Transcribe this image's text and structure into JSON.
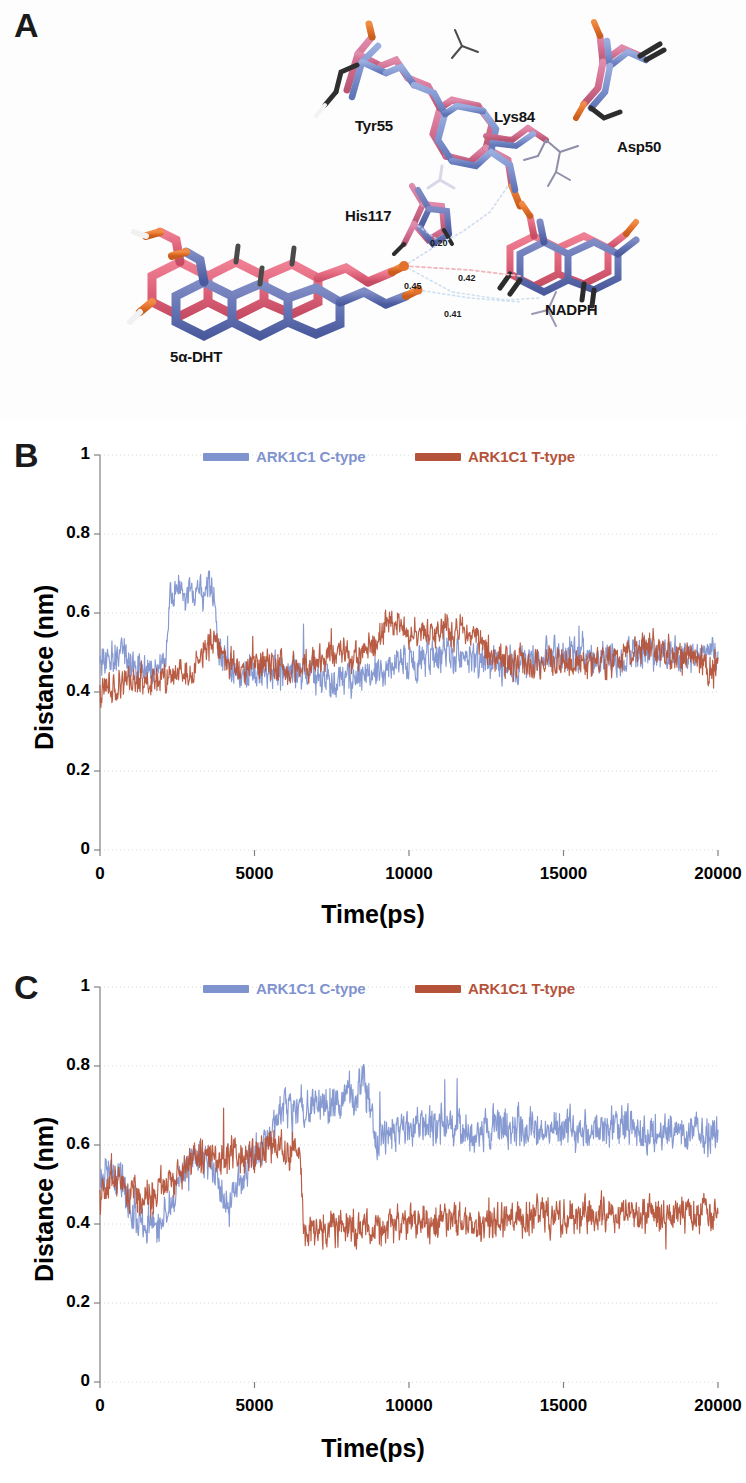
{
  "figure": {
    "panels": [
      {
        "letter": "A",
        "type": "molecular-structure"
      },
      {
        "letter": "B",
        "type": "line-chart"
      },
      {
        "letter": "C",
        "type": "line-chart"
      }
    ]
  },
  "panel_a": {
    "letter": "A",
    "caption_labels": [
      {
        "name": "tyr55",
        "text": "Tyr55",
        "x": 355,
        "y": 117
      },
      {
        "name": "lys84",
        "text": "Lys84",
        "x": 494,
        "y": 108
      },
      {
        "name": "asp50",
        "text": "Asp50",
        "x": 617,
        "y": 138
      },
      {
        "name": "his117",
        "text": "His117",
        "x": 345,
        "y": 207
      },
      {
        "name": "nadph",
        "text": "NADPH",
        "x": 545,
        "y": 301
      },
      {
        "name": "dht",
        "text": "5α-DHT",
        "x": 170,
        "y": 348
      }
    ],
    "distance_labels": [
      {
        "name": "dist-020",
        "text": "0.20",
        "x": 430,
        "y": 238
      },
      {
        "name": "dist-042",
        "text": "0.42",
        "x": 458,
        "y": 273
      },
      {
        "name": "dist-045",
        "text": "0.45",
        "x": 404,
        "y": 281
      },
      {
        "name": "dist-041",
        "text": "0.41",
        "x": 444,
        "y": 309
      }
    ],
    "colors": {
      "c_type_blue": "#7f93cf",
      "t_type_pink": "#d36f91",
      "salmon": "#e0657c",
      "oxygen_orange": "#e2712b",
      "nitrogen_navy": "#3b4a93",
      "carbon_dark": "#2a2a2a",
      "hydrogen_white": "#f4f4f4"
    }
  },
  "panel_b": {
    "letter": "B",
    "legend": [
      {
        "name": "legend-c-type",
        "label": "ARK1C1 C-type",
        "color": "#7f93cf"
      },
      {
        "name": "legend-t-type",
        "label": "ARK1C1 T-type",
        "color": "#b5533a"
      }
    ]
  },
  "panel_c": {
    "letter": "C",
    "legend": [
      {
        "name": "legend-c-type",
        "label": "ARK1C1 C-type",
        "color": "#7f93cf"
      },
      {
        "name": "legend-t-type",
        "label": "ARK1C1 T-type",
        "color": "#b5533a"
      }
    ]
  },
  "chart_data": [
    {
      "panel": "B",
      "type": "line",
      "title": "",
      "xlabel": "Time(ps)",
      "ylabel": "Distance (nm)",
      "xlim": [
        0,
        20000
      ],
      "ylim": [
        0,
        1
      ],
      "xticks": [
        0,
        5000,
        10000,
        15000,
        20000
      ],
      "xtick_labels": [
        "0",
        "5000",
        "10000",
        "15000",
        "20000"
      ],
      "yticks": [
        0,
        0.2,
        0.4,
        0.6,
        0.8,
        1
      ],
      "ytick_labels": [
        "0",
        "0.2",
        "0.4",
        "0.6",
        "0.8",
        "1"
      ],
      "grid": true,
      "legend_position": "top-center",
      "series": [
        {
          "name": "ARK1C1 C-type",
          "color": "#7f93cf",
          "noise": 0.048,
          "seed": 1471,
          "control_points": [
            [
              0,
              0.5
            ],
            [
              300,
              0.47
            ],
            [
              700,
              0.5
            ],
            [
              1100,
              0.47
            ],
            [
              1500,
              0.46
            ],
            [
              1900,
              0.46
            ],
            [
              2150,
              0.48
            ],
            [
              2250,
              0.64
            ],
            [
              2600,
              0.655
            ],
            [
              3000,
              0.655
            ],
            [
              3300,
              0.645
            ],
            [
              3500,
              0.665
            ],
            [
              3700,
              0.635
            ],
            [
              3800,
              0.52
            ],
            [
              4100,
              0.47
            ],
            [
              4600,
              0.455
            ],
            [
              5200,
              0.445
            ],
            [
              5800,
              0.45
            ],
            [
              6400,
              0.445
            ],
            [
              6900,
              0.44
            ],
            [
              7200,
              0.43
            ],
            [
              7700,
              0.425
            ],
            [
              8200,
              0.435
            ],
            [
              8700,
              0.445
            ],
            [
              9200,
              0.455
            ],
            [
              9800,
              0.475
            ],
            [
              10400,
              0.485
            ],
            [
              11000,
              0.49
            ],
            [
              11600,
              0.495
            ],
            [
              12200,
              0.485
            ],
            [
              12800,
              0.47
            ],
            [
              13400,
              0.465
            ],
            [
              14000,
              0.48
            ],
            [
              14500,
              0.5
            ],
            [
              15000,
              0.49
            ],
            [
              15500,
              0.495
            ],
            [
              16100,
              0.485
            ],
            [
              16700,
              0.48
            ],
            [
              17300,
              0.49
            ],
            [
              17900,
              0.5
            ],
            [
              18500,
              0.49
            ],
            [
              19100,
              0.495
            ],
            [
              19600,
              0.5
            ],
            [
              20000,
              0.505
            ]
          ]
        },
        {
          "name": "ARK1C1 T-type",
          "color": "#b5533a",
          "noise": 0.044,
          "seed": 9277,
          "control_points": [
            [
              0,
              0.4
            ],
            [
              300,
              0.42
            ],
            [
              800,
              0.425
            ],
            [
              1400,
              0.43
            ],
            [
              2000,
              0.435
            ],
            [
              2600,
              0.445
            ],
            [
              3100,
              0.455
            ],
            [
              3400,
              0.5
            ],
            [
              3600,
              0.525
            ],
            [
              3900,
              0.5
            ],
            [
              4300,
              0.465
            ],
            [
              4800,
              0.46
            ],
            [
              5300,
              0.475
            ],
            [
              5800,
              0.475
            ],
            [
              6300,
              0.46
            ],
            [
              6800,
              0.465
            ],
            [
              7300,
              0.495
            ],
            [
              7800,
              0.5
            ],
            [
              8300,
              0.495
            ],
            [
              8800,
              0.51
            ],
            [
              9200,
              0.565
            ],
            [
              9500,
              0.585
            ],
            [
              9900,
              0.555
            ],
            [
              10400,
              0.545
            ],
            [
              10900,
              0.555
            ],
            [
              11400,
              0.555
            ],
            [
              11900,
              0.545
            ],
            [
              12300,
              0.53
            ],
            [
              12800,
              0.49
            ],
            [
              13300,
              0.475
            ],
            [
              13900,
              0.475
            ],
            [
              14500,
              0.48
            ],
            [
              15100,
              0.475
            ],
            [
              15700,
              0.47
            ],
            [
              16300,
              0.475
            ],
            [
              16900,
              0.48
            ],
            [
              17500,
              0.5
            ],
            [
              17900,
              0.525
            ],
            [
              18400,
              0.495
            ],
            [
              19000,
              0.485
            ],
            [
              19500,
              0.47
            ],
            [
              20000,
              0.455
            ]
          ]
        }
      ]
    },
    {
      "panel": "C",
      "type": "line",
      "title": "",
      "xlabel": "Time(ps)",
      "ylabel": "Distance (nm)",
      "xlim": [
        0,
        20000
      ],
      "ylim": [
        0,
        1
      ],
      "xticks": [
        0,
        5000,
        10000,
        15000,
        20000
      ],
      "xtick_labels": [
        "0",
        "5000",
        "10000",
        "15000",
        "20000"
      ],
      "yticks": [
        0,
        0.2,
        0.4,
        0.6,
        0.8,
        1
      ],
      "ytick_labels": [
        "0",
        "0.2",
        "0.4",
        "0.6",
        "0.8",
        "1"
      ],
      "grid": true,
      "legend_position": "top-center",
      "series": [
        {
          "name": "ARK1C1 C-type",
          "color": "#7f93cf",
          "noise": 0.055,
          "seed": 3313,
          "control_points": [
            [
              0,
              0.52
            ],
            [
              300,
              0.55
            ],
            [
              700,
              0.5
            ],
            [
              1100,
              0.43
            ],
            [
              1500,
              0.395
            ],
            [
              1900,
              0.4
            ],
            [
              2300,
              0.455
            ],
            [
              2700,
              0.545
            ],
            [
              3100,
              0.585
            ],
            [
              3500,
              0.555
            ],
            [
              3900,
              0.5
            ],
            [
              4200,
              0.455
            ],
            [
              4500,
              0.51
            ],
            [
              4900,
              0.565
            ],
            [
              5300,
              0.595
            ],
            [
              5700,
              0.655
            ],
            [
              6000,
              0.695
            ],
            [
              6400,
              0.695
            ],
            [
              6900,
              0.7
            ],
            [
              7400,
              0.705
            ],
            [
              7900,
              0.71
            ],
            [
              8300,
              0.735
            ],
            [
              8500,
              0.775
            ],
            [
              8700,
              0.71
            ],
            [
              8900,
              0.6
            ],
            [
              9200,
              0.625
            ],
            [
              9700,
              0.64
            ],
            [
              10300,
              0.635
            ],
            [
              10900,
              0.645
            ],
            [
              11500,
              0.645
            ],
            [
              12100,
              0.635
            ],
            [
              12700,
              0.645
            ],
            [
              13300,
              0.64
            ],
            [
              13900,
              0.65
            ],
            [
              14500,
              0.645
            ],
            [
              15100,
              0.635
            ],
            [
              15700,
              0.63
            ],
            [
              16300,
              0.645
            ],
            [
              16900,
              0.655
            ],
            [
              17500,
              0.635
            ],
            [
              18100,
              0.63
            ],
            [
              18700,
              0.645
            ],
            [
              19300,
              0.64
            ],
            [
              20000,
              0.625
            ]
          ]
        },
        {
          "name": "ARK1C1 T-type",
          "color": "#b5533a",
          "noise": 0.05,
          "seed": 7731,
          "control_points": [
            [
              0,
              0.47
            ],
            [
              300,
              0.5
            ],
            [
              700,
              0.52
            ],
            [
              1100,
              0.475
            ],
            [
              1500,
              0.455
            ],
            [
              1900,
              0.475
            ],
            [
              2300,
              0.5
            ],
            [
              2700,
              0.535
            ],
            [
              3100,
              0.565
            ],
            [
              3500,
              0.575
            ],
            [
              3900,
              0.555
            ],
            [
              4300,
              0.575
            ],
            [
              4700,
              0.565
            ],
            [
              5100,
              0.585
            ],
            [
              5500,
              0.595
            ],
            [
              5900,
              0.585
            ],
            [
              6200,
              0.59
            ],
            [
              6450,
              0.585
            ],
            [
              6600,
              0.395
            ],
            [
              6900,
              0.385
            ],
            [
              7300,
              0.38
            ],
            [
              7800,
              0.385
            ],
            [
              8300,
              0.385
            ],
            [
              8800,
              0.385
            ],
            [
              9300,
              0.405
            ],
            [
              9800,
              0.395
            ],
            [
              10300,
              0.4
            ],
            [
              10800,
              0.405
            ],
            [
              11300,
              0.4
            ],
            [
              11800,
              0.405
            ],
            [
              12300,
              0.405
            ],
            [
              12800,
              0.41
            ],
            [
              13300,
              0.405
            ],
            [
              13800,
              0.425
            ],
            [
              14300,
              0.43
            ],
            [
              14800,
              0.415
            ],
            [
              15300,
              0.415
            ],
            [
              15800,
              0.425
            ],
            [
              16300,
              0.425
            ],
            [
              16800,
              0.425
            ],
            [
              17300,
              0.42
            ],
            [
              17800,
              0.425
            ],
            [
              18300,
              0.425
            ],
            [
              18800,
              0.43
            ],
            [
              19300,
              0.425
            ],
            [
              20000,
              0.44
            ]
          ]
        }
      ]
    }
  ],
  "axis_style": {
    "plot_left": 100,
    "plot_right": 718,
    "grid_color": "#d8d8d8",
    "axis_color": "#808080"
  }
}
